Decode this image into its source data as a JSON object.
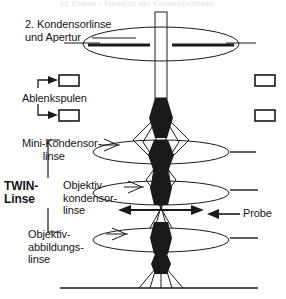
{
  "figure": {
    "title_cut": "12 Einbau / Funktion der Kondensorlinsen",
    "type": "ray-diagram"
  },
  "labels": {
    "condenser2": "2. Kondensorlinse\nund Apertur",
    "deflection_coils": "Ablenkspulen",
    "mini_condenser": "Mini-Kondensor-\n       linse",
    "twin_lens": "TWIN-\nLinse",
    "objective_condenser": "Objektiv-\nkondensor-\nlinse",
    "objective_imaging": "Objektiv-\nabbildungs-\nlinse",
    "specimen": "Probe"
  },
  "colors": {
    "ink": "#141414",
    "beam": "#1a1a1a",
    "background": "#ffffff"
  },
  "elements": {
    "coil_boxes": 4,
    "lenses": 4,
    "crossovers": 5
  }
}
